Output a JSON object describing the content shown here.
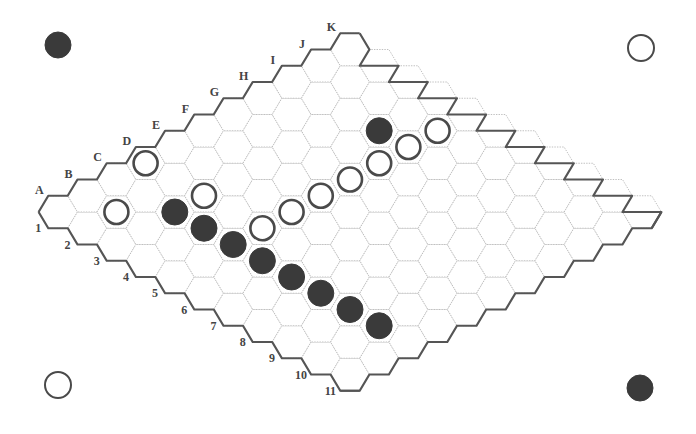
{
  "board": {
    "size": 11,
    "column_labels": [
      "A",
      "B",
      "C",
      "D",
      "E",
      "F",
      "G",
      "H",
      "I",
      "J",
      "K"
    ],
    "row_labels": [
      "1",
      "2",
      "3",
      "4",
      "5",
      "6",
      "7",
      "8",
      "9",
      "10",
      "11"
    ],
    "colors": {
      "black_stone": "#3a3a3a",
      "white_stone_fill": "#ffffff",
      "white_stone_stroke": "#4a4a4a",
      "border": "#555555",
      "grid": "#b9b9b9",
      "background": "#ffffff"
    },
    "stones": [
      {
        "cell": "D1",
        "color": "white"
      },
      {
        "cell": "B2",
        "color": "white"
      },
      {
        "cell": "C3",
        "color": "black"
      },
      {
        "cell": "D3",
        "color": "white"
      },
      {
        "cell": "C4",
        "color": "black"
      },
      {
        "cell": "C5",
        "color": "black"
      },
      {
        "cell": "D5",
        "color": "white"
      },
      {
        "cell": "E5",
        "color": "white"
      },
      {
        "cell": "F5",
        "color": "white"
      },
      {
        "cell": "G5",
        "color": "white"
      },
      {
        "cell": "H5",
        "color": "white"
      },
      {
        "cell": "I5",
        "color": "white"
      },
      {
        "cell": "J5",
        "color": "white"
      },
      {
        "cell": "I4",
        "color": "black"
      },
      {
        "cell": "C6",
        "color": "black"
      },
      {
        "cell": "C7",
        "color": "black"
      },
      {
        "cell": "C8",
        "color": "black"
      },
      {
        "cell": "C9",
        "color": "black"
      },
      {
        "cell": "C10",
        "color": "black"
      }
    ]
  },
  "corner_markers": [
    {
      "position": "top-left",
      "color": "black",
      "x": 58,
      "y": 45
    },
    {
      "position": "top-right",
      "color": "white",
      "x": 641,
      "y": 48
    },
    {
      "position": "bottom-left",
      "color": "white",
      "x": 58,
      "y": 385
    },
    {
      "position": "bottom-right",
      "color": "black",
      "x": 640,
      "y": 388
    }
  ]
}
